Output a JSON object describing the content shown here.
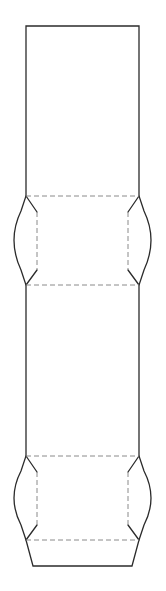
{
  "document": {
    "title": "Carton Dieline Template",
    "description": "Flat packaging dieline for a tuck-end folding carton",
    "canvas": {
      "width": 166,
      "height": 591,
      "background_color": "#ffffff"
    }
  },
  "styles": {
    "cut_line": {
      "name": "cut-line",
      "color": "#2b2b2b",
      "width": 1.3,
      "dash": "none"
    },
    "fold_line": {
      "name": "fold-crease-line",
      "color": "#8a8a8a",
      "width": 1,
      "dash": "5 3"
    }
  },
  "geometry": {
    "panel_left_x": 26,
    "panel_right_x": 139,
    "top_edge_y": 26,
    "fold_y_1": 196,
    "fold_y_2": 285,
    "fold_y_3": 456,
    "fold_y_4": 540,
    "bottom_edge_y": 566,
    "ear_left_outer_x": 7,
    "ear_right_outer_x": 158,
    "ear_inner_left_x": 37,
    "ear_inner_right_x": 128,
    "ear_shoulder_offset": 15,
    "bottom_flare_x_left": 33,
    "bottom_flare_x_right": 132
  },
  "shapes": {
    "cut_outline_path": "M 26 26 L 139 26 L 139 196 L 144 211 Q 158 240 144 270 L 139 285 L 139 456 L 144 471 Q 158 498 144 525 L 139 540 L 132 566 L 33 566 L 26 540 L 21 525 Q 7 498 21 471 L 26 456 L 26 285 L 21 270 Q 7 240 21 211 L 26 196 Z",
    "fold_lines": [
      {
        "name": "top-panel-fold",
        "x1": 26,
        "y1": 196,
        "x2": 139,
        "y2": 196
      },
      {
        "name": "upper-body-fold",
        "x1": 26,
        "y1": 285,
        "x2": 139,
        "y2": 285
      },
      {
        "name": "lower-body-fold",
        "x1": 26,
        "y1": 456,
        "x2": 139,
        "y2": 456
      },
      {
        "name": "bottom-panel-fold",
        "x1": 26,
        "y1": 540,
        "x2": 139,
        "y2": 540
      },
      {
        "name": "upper-left-ear-fold",
        "x1": 37,
        "y1": 212,
        "x2": 37,
        "y2": 270
      },
      {
        "name": "upper-right-ear-fold",
        "x1": 128,
        "y1": 212,
        "x2": 128,
        "y2": 270
      },
      {
        "name": "lower-left-ear-fold",
        "x1": 37,
        "y1": 472,
        "x2": 37,
        "y2": 525
      },
      {
        "name": "lower-right-ear-fold",
        "x1": 128,
        "y1": 472,
        "x2": 128,
        "y2": 525
      }
    ],
    "ear_shoulder_cuts": [
      {
        "name": "upper-left-ear-top-shoulder",
        "x1": 26,
        "y1": 196,
        "x2": 37,
        "y2": 212
      },
      {
        "name": "upper-left-ear-bottom-shoulder",
        "x1": 26,
        "y1": 285,
        "x2": 37,
        "y2": 270
      },
      {
        "name": "upper-right-ear-top-shoulder",
        "x1": 139,
        "y1": 196,
        "x2": 128,
        "y2": 212
      },
      {
        "name": "upper-right-ear-bottom-shoulder",
        "x1": 139,
        "y1": 285,
        "x2": 128,
        "y2": 270
      },
      {
        "name": "lower-left-ear-top-shoulder",
        "x1": 26,
        "y1": 456,
        "x2": 37,
        "y2": 472
      },
      {
        "name": "lower-left-ear-bottom-shoulder",
        "x1": 26,
        "y1": 540,
        "x2": 37,
        "y2": 525
      },
      {
        "name": "lower-right-ear-top-shoulder",
        "x1": 139,
        "y1": 456,
        "x2": 128,
        "y2": 472
      },
      {
        "name": "lower-right-ear-bottom-shoulder",
        "x1": 139,
        "y1": 540,
        "x2": 128,
        "y2": 525
      }
    ]
  },
  "panels": [
    {
      "name": "top-tuck-panel",
      "label": "",
      "x": 26,
      "y": 26,
      "width": 113,
      "height": 170
    },
    {
      "name": "upper-side-panel",
      "label": "",
      "x": 26,
      "y": 196,
      "width": 113,
      "height": 89
    },
    {
      "name": "main-front-panel",
      "label": "",
      "x": 26,
      "y": 285,
      "width": 113,
      "height": 171
    },
    {
      "name": "lower-side-panel",
      "label": "",
      "x": 26,
      "y": 456,
      "width": 113,
      "height": 84
    },
    {
      "name": "bottom-tuck-panel",
      "label": "",
      "x": 26,
      "y": 540,
      "width": 113,
      "height": 26
    }
  ],
  "flaps": [
    {
      "name": "upper-left-ear-flap",
      "side": "left",
      "top_y": 196,
      "bottom_y": 285
    },
    {
      "name": "upper-right-ear-flap",
      "side": "right",
      "top_y": 196,
      "bottom_y": 285
    },
    {
      "name": "lower-left-ear-flap",
      "side": "left",
      "top_y": 456,
      "bottom_y": 540
    },
    {
      "name": "lower-right-ear-flap",
      "side": "right",
      "top_y": 456,
      "bottom_y": 540
    }
  ]
}
